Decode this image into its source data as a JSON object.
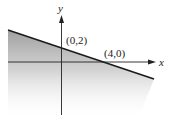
{
  "diagram": {
    "type": "linear-inequality-graph",
    "axes": {
      "x_label": "x",
      "y_label": "y"
    },
    "line": {
      "points": [
        {
          "label": "(0,2)",
          "x": 0,
          "y": 2
        },
        {
          "label": "(4,0)",
          "x": 4,
          "y": 0
        }
      ]
    },
    "shaded_region": "below line",
    "colors": {
      "line": "#1a1a1a",
      "shade": "#9a9a9a",
      "axes": "#222222"
    }
  }
}
